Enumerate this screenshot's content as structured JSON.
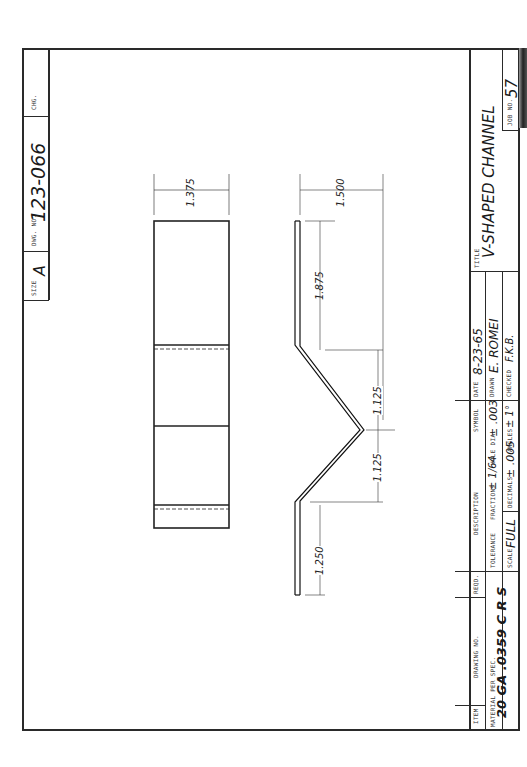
{
  "sheet": {
    "size_label": "SIZE",
    "size": "A",
    "dwg_no_label": "DWG. NO.",
    "dwg_no": "123-066",
    "chg_label": "CHG."
  },
  "title_block": {
    "title_label": "TITLE",
    "title": "V-SHAPED   CHANNEL",
    "job_no_label": "JOB NO.",
    "job_no": "57",
    "date_label": "DATE",
    "date": "8-23-65",
    "drawn_label": "DRAWN",
    "drawn": "E. ROMEI",
    "checked_label": "CHECKED",
    "checked": "F.K.B.",
    "symbol_label": "SYMBOL",
    "description_label": "DESCRIPTION",
    "tolerance_label": "TOLERANCE",
    "fractions_label": "FRACTIONS",
    "fractions_value": "± 1/64",
    "hole_dia_label": "HOLE DIA.",
    "hole_dia_value": "± .003",
    "scale_label": "SCALE",
    "scale": "FULL",
    "decimals_label": "DECIMALS",
    "decimals_value": "± .005",
    "angles_label": "ANGLES",
    "angles_value": "± 1°",
    "reqd_label": "REQD.",
    "drawing_no_label": "DRAWING NO.",
    "item_label": "ITEM",
    "material_label": "MATERIAL PER SPEC.",
    "material": "20 GA .0359 C R S"
  },
  "dimensions": {
    "top_view_width": "1.375",
    "front_view_width": "1.500",
    "upper_leg": "1.875",
    "v_upper": "1.125",
    "v_lower": "1.125",
    "lower_leg": "1.250"
  }
}
